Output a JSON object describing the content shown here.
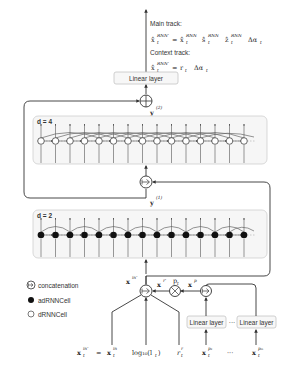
{
  "top": {
    "main_track_label": "Main track:",
    "main_track_lhs": "x̂",
    "main_track_lhs_sup": "RNN'",
    "main_track_terms": [
      {
        "base": "x̂",
        "sup": "RNN",
        "sub": "t"
      },
      {
        "base": "ŝ",
        "sup": "RNN",
        "sub": "t"
      },
      {
        "base": "ẑ",
        "sup": "RNN",
        "sub": "t"
      },
      {
        "base": "Δα",
        "sup": "",
        "sub": "t"
      }
    ],
    "context_track_label": "Context track:",
    "context_track_lhs": "x̂",
    "context_track_lhs_sup": "RNN'",
    "context_track_terms": [
      {
        "base": "r",
        "sup": "",
        "sub": "t"
      },
      {
        "base": "Δα",
        "sup": "",
        "sub": "t"
      }
    ],
    "sub_t": "t",
    "equals": "="
  },
  "linear_layer_top": "Linear layer",
  "sum_label": "y",
  "sum_label_sup": "(2)",
  "block_d4": {
    "label": "d = 4",
    "cell_type": "dRNNCell",
    "cells": 15
  },
  "block_d2": {
    "label": "d = 2",
    "cell_type": "adRNNCell",
    "cells": 15
  },
  "y1_label": "y",
  "y1_label_sup": "(1)",
  "legend": [
    {
      "icon": "concatenation-icon",
      "label": "concatenation"
    },
    {
      "icon": "filled-circle-icon",
      "label": "adRNNCell"
    },
    {
      "icon": "hollow-circle-icon",
      "label": "dRNNCell"
    }
  ],
  "input": {
    "xin_label": "x",
    "xin_sup": "in'",
    "xr_label": "x",
    "xr_sup": "r'",
    "p_label": "p",
    "xp_label": "x",
    "xp_sup": "p",
    "linear_layer_left": "Linear layer",
    "ellipsis": "···",
    "linear_layer_right": "Linear layer"
  },
  "bottom_equation": {
    "lhs": "x",
    "lhs_sup": "in'",
    "equals": "=",
    "terms": [
      {
        "base": "x",
        "sup": "in",
        "sub": "t"
      },
      {
        "base": "log₁₀(l",
        "sup": "",
        "sub": "t",
        "suffix": ")"
      },
      {
        "base": "r",
        "sup": "r",
        "sub": "t"
      },
      {
        "base": "x",
        "sup": "p₁",
        "sub": "t"
      },
      {
        "base": "···",
        "sup": "",
        "sub": ""
      },
      {
        "base": "x",
        "sup": "pₘ",
        "sub": "t"
      }
    ]
  }
}
